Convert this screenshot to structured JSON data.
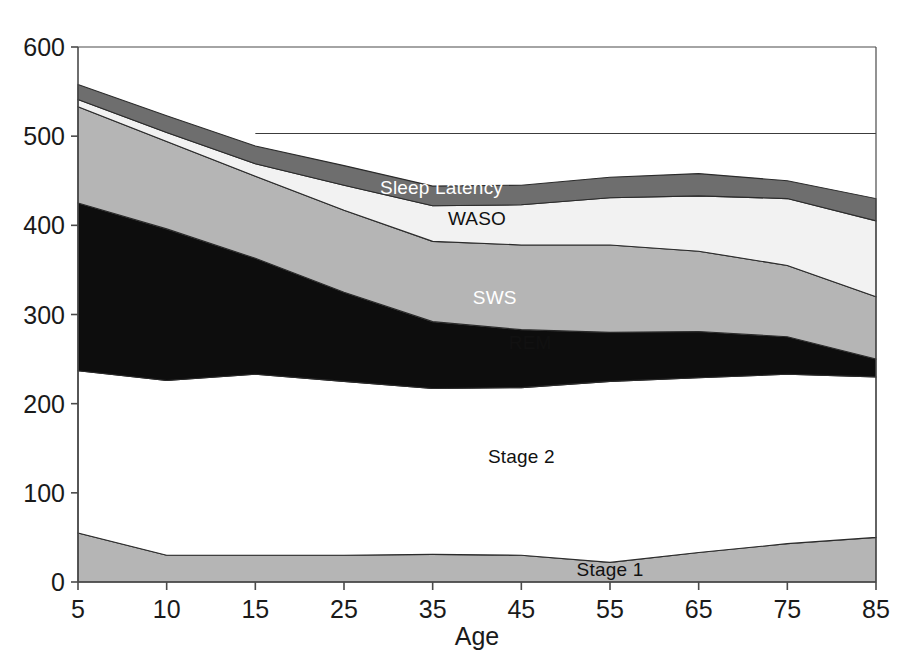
{
  "chart_data": {
    "type": "area",
    "title": "",
    "subtitle": "",
    "xlabel": "Age",
    "ylabel": "",
    "x": [
      5,
      10,
      15,
      25,
      35,
      45,
      55,
      65,
      75,
      85
    ],
    "categories": [
      "5",
      "10",
      "15",
      "25",
      "35",
      "45",
      "55",
      "65",
      "75",
      "85"
    ],
    "xtick_labels": [
      "5",
      "10",
      "15",
      "25",
      "35",
      "45",
      "55",
      "65",
      "75",
      "85"
    ],
    "ytick_labels": [
      "0",
      "100",
      "200",
      "300",
      "400",
      "500",
      "600"
    ],
    "yticks": [
      0,
      100,
      200,
      300,
      400,
      500,
      600
    ],
    "ylim": [
      0,
      600
    ],
    "xlim": [
      5,
      85
    ],
    "grid": false,
    "stacked": true,
    "legend": "inline-labels",
    "units": "minutes",
    "series": [
      {
        "name": "Stage 1",
        "color": "#b5b5b5",
        "label_x": 55,
        "label_y": 14,
        "values": [
          55,
          30,
          30,
          30,
          31,
          30,
          22,
          33,
          43,
          50
        ]
      },
      {
        "name": "Stage 2",
        "color": "#ffffff",
        "label_x": 45,
        "label_y": 140,
        "values": [
          182,
          196,
          203,
          195,
          186,
          188,
          203,
          196,
          190,
          180
        ]
      },
      {
        "name": "SWS",
        "color": "#0d0d0d",
        "label_x": 42,
        "label_y": 318,
        "values": [
          188,
          170,
          130,
          100,
          75,
          65,
          55,
          52,
          42,
          20
        ]
      },
      {
        "name": "REM",
        "color": "#b5b5b5",
        "label_x": 46,
        "label_y": 268,
        "values": [
          108,
          98,
          92,
          92,
          90,
          95,
          98,
          90,
          80,
          70
        ]
      },
      {
        "name": "WASO",
        "color": "#f2f2f2",
        "label_x": 40,
        "label_y": 407,
        "values": [
          8,
          10,
          14,
          28,
          40,
          45,
          53,
          62,
          75,
          85
        ]
      },
      {
        "name": "Sleep Latency",
        "color": "#6e6e6e",
        "label_x": 36,
        "label_y": 442,
        "values": [
          17,
          19,
          20,
          22,
          22,
          22,
          23,
          25,
          20,
          25
        ]
      }
    ],
    "reference_line": {
      "name": "upper-reference-line",
      "y": 503,
      "x_start": 15,
      "x_end": 85,
      "color": "#3c3c3c"
    },
    "totals": [
      558,
      523,
      489,
      467,
      444,
      445,
      454,
      458,
      450,
      430
    ]
  },
  "axis": {
    "x_title": "Age",
    "frame_color": "#4a4a4a"
  }
}
